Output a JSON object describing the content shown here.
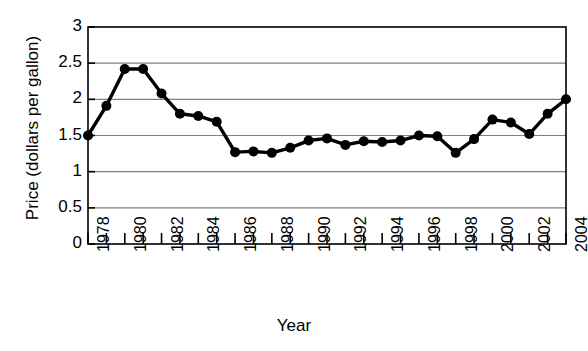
{
  "chart_data": {
    "type": "line",
    "title": "",
    "xlabel": "Year",
    "ylabel": "Price (dollars per gallon)",
    "xlim": [
      1978,
      2004
    ],
    "ylim": [
      0,
      3
    ],
    "yticks": [
      "0",
      "0.5",
      "1",
      "1.5",
      "2",
      "2.5",
      "3"
    ],
    "ytick_values": [
      0,
      0.5,
      1,
      1.5,
      2,
      2.5,
      3
    ],
    "xticks": [
      "1978",
      "1980",
      "1982",
      "1984",
      "1986",
      "1988",
      "1990",
      "1992",
      "1994",
      "1996",
      "1998",
      "2000",
      "2002",
      "2004"
    ],
    "xtick_values": [
      1978,
      1980,
      1982,
      1984,
      1986,
      1988,
      1990,
      1992,
      1994,
      1996,
      1998,
      2000,
      2002,
      2004
    ],
    "xtick_minor_step": 1,
    "grid": "horizontal",
    "legend": "none",
    "marker": "filled-circle",
    "line_color": "#000000",
    "grid_color": "#808080",
    "axis_color": "#000000",
    "x": [
      1978,
      1979,
      1980,
      1981,
      1982,
      1983,
      1984,
      1985,
      1986,
      1987,
      1988,
      1989,
      1990,
      1991,
      1992,
      1993,
      1994,
      1995,
      1996,
      1997,
      1998,
      1999,
      2000,
      2001,
      2002,
      2003,
      2004
    ],
    "values": [
      1.5,
      1.91,
      2.42,
      2.42,
      2.08,
      1.8,
      1.77,
      1.69,
      1.27,
      1.28,
      1.26,
      1.33,
      1.43,
      1.46,
      1.37,
      1.42,
      1.41,
      1.43,
      1.5,
      1.49,
      1.26,
      1.45,
      1.72,
      1.68,
      1.52,
      1.8,
      2.0
    ]
  }
}
